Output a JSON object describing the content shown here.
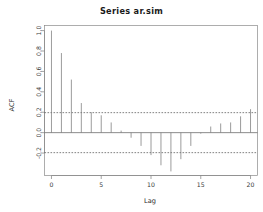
{
  "plot": {
    "title": "Series  ar.sim",
    "xlabel": "Lag",
    "ylabel": "ACF"
  },
  "chart_data": {
    "type": "bar",
    "title": "Series  ar.sim",
    "xlabel": "Lag",
    "ylabel": "ACF",
    "categories": [
      0,
      1,
      2,
      3,
      4,
      5,
      6,
      7,
      8,
      9,
      10,
      11,
      12,
      13,
      14,
      15,
      16,
      17,
      18,
      19,
      20
    ],
    "values": [
      1.0,
      0.78,
      0.52,
      0.29,
      0.2,
      0.17,
      0.1,
      0.02,
      -0.05,
      -0.13,
      -0.22,
      -0.32,
      -0.38,
      -0.26,
      -0.13,
      -0.01,
      0.06,
      0.09,
      0.1,
      0.16,
      0.23
    ],
    "x": [
      0,
      1,
      2,
      3,
      4,
      5,
      6,
      7,
      8,
      9,
      10,
      11,
      12,
      13,
      14,
      15,
      16,
      17,
      18,
      19,
      20
    ],
    "xlim": [
      -0.7,
      20.7
    ],
    "ylim": [
      -0.42,
      1.05
    ],
    "xticks": [
      0,
      5,
      10,
      15,
      20
    ],
    "xticklabels": [
      "0",
      "5",
      "10",
      "15",
      "20"
    ],
    "yticks": [
      -0.2,
      0.0,
      0.2,
      0.4,
      0.6,
      0.8,
      1.0
    ],
    "yticklabels": [
      "-0.2",
      "0.0",
      "0.2",
      "0.4",
      "0.6",
      "0.8",
      "1.0"
    ],
    "grid": false,
    "legend": null,
    "annotations": [
      {
        "name": "upper-confidence-band",
        "value": 0.196,
        "style": "dashed"
      },
      {
        "name": "lower-confidence-band",
        "value": -0.196,
        "style": "dashed"
      },
      {
        "name": "zero-line",
        "value": 0.0,
        "style": "solid"
      }
    ],
    "colors": {
      "bar": "#7a7a7a",
      "confidence": "#4a4a4a",
      "axis": "#7d7d7d",
      "text": "#2b2b2b"
    }
  }
}
